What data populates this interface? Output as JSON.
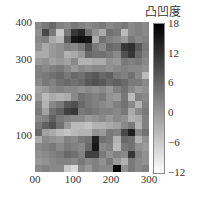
{
  "chart_data": {
    "type": "heatmap",
    "title": "",
    "xlabel": "",
    "ylabel": "",
    "colorbar_label": "凸凹度",
    "colormap": "gray_r",
    "vmin": -12,
    "vmax": 18,
    "xlim": [
      0,
      300
    ],
    "ylim": [
      0,
      400
    ],
    "x_ticks": [
      "00",
      "100",
      "200",
      "300"
    ],
    "y_ticks": [
      "400",
      "300",
      "200",
      "100"
    ],
    "colorbar_ticks": [
      "18",
      "12",
      "6",
      "0",
      "−6",
      "−12"
    ],
    "n_cols": 16,
    "n_rows": 21,
    "row_order": "top_to_bottom (y=400 down to y=0)",
    "values": [
      [
        2,
        4,
        6,
        3,
        2,
        4,
        3,
        2,
        3,
        4,
        2,
        3,
        4,
        2,
        3,
        2
      ],
      [
        1,
        10,
        4,
        -6,
        4,
        12,
        14,
        5,
        1,
        -2,
        5,
        4,
        -4,
        2,
        3,
        2
      ],
      [
        2,
        3,
        -2,
        -4,
        8,
        16,
        17,
        16,
        -2,
        5,
        3,
        2,
        0,
        4,
        2,
        3
      ],
      [
        1,
        -2,
        0,
        1,
        3,
        2,
        4,
        9,
        4,
        2,
        6,
        5,
        12,
        13,
        8,
        4
      ],
      [
        -2,
        -2,
        0,
        1,
        -3,
        -2,
        0,
        6,
        5,
        5,
        4,
        2,
        9,
        12,
        6,
        3
      ],
      [
        0,
        1,
        -1,
        0,
        -1,
        2,
        -3,
        -3,
        -2,
        -2,
        1,
        0,
        4,
        3,
        4,
        2
      ],
      [
        3,
        2,
        3,
        4,
        2,
        0,
        2,
        1,
        2,
        2,
        1,
        2,
        3,
        2,
        2,
        1
      ],
      [
        3,
        4,
        5,
        6,
        4,
        6,
        5,
        7,
        8,
        6,
        7,
        4,
        3,
        5,
        2,
        -4
      ],
      [
        2,
        4,
        3,
        5,
        6,
        5,
        6,
        8,
        9,
        8,
        6,
        7,
        6,
        4,
        4,
        2
      ],
      [
        -1,
        0,
        2,
        3,
        2,
        2,
        1,
        2,
        1,
        2,
        0,
        3,
        5,
        2,
        0,
        1
      ],
      [
        0,
        -4,
        -2,
        -3,
        -2,
        2,
        5,
        4,
        3,
        4,
        1,
        0,
        4,
        -4,
        3,
        2
      ],
      [
        3,
        -3,
        2,
        4,
        8,
        9,
        6,
        4,
        3,
        2,
        1,
        3,
        5,
        2,
        -3,
        3
      ],
      [
        4,
        -1,
        5,
        7,
        11,
        12,
        4,
        5,
        4,
        3,
        3,
        2,
        4,
        -2,
        2,
        4
      ],
      [
        2,
        3,
        7,
        4,
        3,
        2,
        2,
        0,
        1,
        2,
        0,
        2,
        1,
        -3,
        -2,
        3
      ],
      [
        4,
        7,
        9,
        5,
        0,
        -4,
        -4,
        -5,
        -3,
        -3,
        -2,
        -1,
        2,
        4,
        -3,
        3
      ],
      [
        6,
        -1,
        -2,
        -4,
        -5,
        -4,
        -3,
        -3,
        1,
        0,
        4,
        3,
        10,
        15,
        2,
        5
      ],
      [
        -2,
        2,
        1,
        0,
        3,
        2,
        4,
        5,
        15,
        5,
        4,
        -3,
        6,
        5,
        -3,
        1
      ],
      [
        2,
        3,
        4,
        2,
        4,
        3,
        2,
        6,
        16,
        2,
        3,
        -4,
        4,
        5,
        1,
        0
      ],
      [
        1,
        2,
        3,
        4,
        6,
        5,
        3,
        11,
        11,
        4,
        1,
        3,
        2,
        12,
        3,
        1
      ],
      [
        0,
        1,
        2,
        3,
        3,
        2,
        4,
        2,
        3,
        1,
        4,
        0,
        -3,
        4,
        2,
        1
      ],
      [
        2,
        3,
        2,
        2,
        -6,
        -8,
        2,
        0,
        3,
        2,
        2,
        18,
        1,
        4,
        2,
        3
      ]
    ]
  },
  "axes": {
    "x_ticks": [
      {
        "label": "00",
        "pos": 35
      },
      {
        "label": "100",
        "pos": 73
      },
      {
        "label": "200",
        "pos": 111
      },
      {
        "label": "300",
        "pos": 149
      }
    ],
    "y_ticks": [
      {
        "label": "400",
        "pos": 22
      },
      {
        "label": "300",
        "pos": 59
      },
      {
        "label": "200",
        "pos": 97
      },
      {
        "label": "100",
        "pos": 135
      }
    ]
  },
  "colorbar": {
    "label": "凸凹度",
    "ticks": [
      {
        "label": "18",
        "pos": 23
      },
      {
        "label": "12",
        "pos": 53
      },
      {
        "label": "6",
        "pos": 82
      },
      {
        "label": "0",
        "pos": 112
      },
      {
        "label": "−6",
        "pos": 142
      },
      {
        "label": "−12",
        "pos": 172
      }
    ]
  }
}
